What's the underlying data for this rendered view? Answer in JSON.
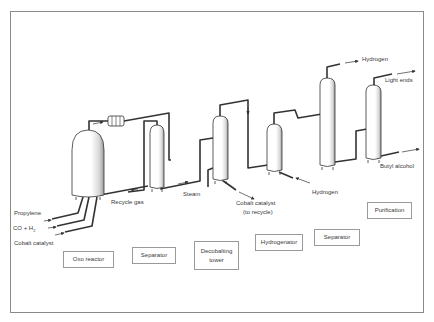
{
  "diagram": {
    "units": [
      {
        "id": "oxo-reactor",
        "label": "Oxo reactor"
      },
      {
        "id": "separator-1",
        "label": "Separator"
      },
      {
        "id": "decobalting-tower",
        "label": "Decobalting tower",
        "lines": [
          "Decobalting",
          "tower"
        ]
      },
      {
        "id": "hydrogenator",
        "label": "Hydrogenator"
      },
      {
        "id": "separator-2",
        "label": "Separator"
      },
      {
        "id": "purification",
        "label": "Purification"
      }
    ],
    "streams": {
      "propylene": "Propylene",
      "co_h2": "CO + H",
      "co_h2_sub": "2",
      "cobalt_catalyst_in": "Cobalt catalyst",
      "recycle_gas": "Recycle gas",
      "steam": "Steam",
      "cobalt_catalyst_out_1": "Cobalt catalyst",
      "cobalt_catalyst_out_2": "(to recycle)",
      "hydrogen_in": "Hydrogen",
      "hydrogen_out": "Hydrogen",
      "light_ends": "Light ends",
      "butyl_alcohol": "Butyl alcohol"
    },
    "edges": [
      {
        "from": "Propylene",
        "to": "Oxo reactor"
      },
      {
        "from": "CO + H2",
        "to": "Oxo reactor"
      },
      {
        "from": "Cobalt catalyst",
        "to": "Oxo reactor"
      },
      {
        "from": "Oxo reactor",
        "to": "Separator",
        "via": "heat exchanger"
      },
      {
        "from": "Separator",
        "to": "Oxo reactor",
        "label": "Recycle gas"
      },
      {
        "from": "Separator",
        "to": "Decobalting tower"
      },
      {
        "from": "Steam",
        "to": "Decobalting tower"
      },
      {
        "from": "Decobalting tower",
        "to": "Cobalt catalyst (to recycle)"
      },
      {
        "from": "Decobalting tower",
        "to": "Hydrogenator"
      },
      {
        "from": "Hydrogen",
        "to": "Hydrogenator"
      },
      {
        "from": "Hydrogenator",
        "to": "Separator"
      },
      {
        "from": "Separator",
        "to": "Hydrogen"
      },
      {
        "from": "Separator",
        "to": "Purification"
      },
      {
        "from": "Purification",
        "to": "Light ends"
      },
      {
        "from": "Purification",
        "to": "Butyl alcohol"
      }
    ]
  },
  "colors": {
    "line": "#333333",
    "frame": "#8a8a8a",
    "text": "#3a3a3a"
  }
}
